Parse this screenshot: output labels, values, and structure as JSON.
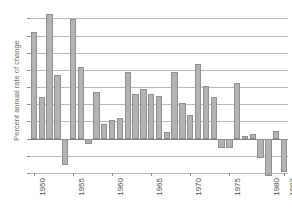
{
  "chart_data": {
    "type": "bar",
    "title": "",
    "xlabel": "",
    "ylabel": "Percent annual rate of change",
    "ylim": [
      -2,
      7.6
    ],
    "yticks": [
      7,
      6,
      5,
      4,
      3,
      2,
      1,
      0,
      -1,
      -2
    ],
    "ytick_labels": [
      "7",
      "6",
      "5",
      "4",
      "3",
      "2",
      "1",
      "0",
      "-1",
      "-2"
    ],
    "xticks": [
      1950,
      1955,
      1960,
      1965,
      1970,
      1975,
      1980,
      1982
    ],
    "xtick_labels": [
      "1950",
      "1955",
      "1960",
      "1965",
      "1970",
      "1975",
      "1980",
      "1982"
    ],
    "grid": true,
    "legend": false,
    "bar_color": "#b3b3b3",
    "bar_edge_color": "#8f8f8f",
    "grid_color": "#b9b9b9",
    "zero_line_color": "#808080",
    "categories": [
      1950,
      1951,
      1952,
      1953,
      1954,
      1955,
      1956,
      1957,
      1958,
      1959,
      1960,
      1961,
      1962,
      1963,
      1964,
      1965,
      1966,
      1967,
      1968,
      1969,
      1970,
      1971,
      1972,
      1973,
      1974,
      1975,
      1976,
      1977,
      1978,
      1979,
      1980,
      1981,
      1982
    ],
    "values": [
      6.2,
      2.45,
      7.25,
      3.7,
      -1.55,
      6.95,
      4.15,
      -0.3,
      2.7,
      0.85,
      1.1,
      1.2,
      3.9,
      2.6,
      2.9,
      2.6,
      2.5,
      0.4,
      3.85,
      2.05,
      1.4,
      4.35,
      3.05,
      2.4,
      -0.55,
      -0.55,
      3.25,
      0.15,
      0.25,
      -1.1,
      -2.2,
      0.45,
      -1.95
    ]
  }
}
